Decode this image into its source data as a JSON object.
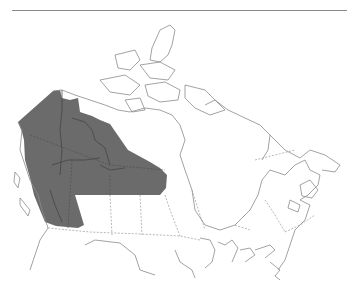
{
  "map": {
    "subject": "Canada",
    "type": "species range map",
    "range_fill_color": "#6b6b6b",
    "outline_color": "#8c8c8c",
    "background_color": "#ffffff",
    "highlighted_region": "northwestern Canada (Yukon, western Northwest Territories, northern British Columbia, northern Alberta, northern Saskatchewan, northern Manitoba)"
  }
}
